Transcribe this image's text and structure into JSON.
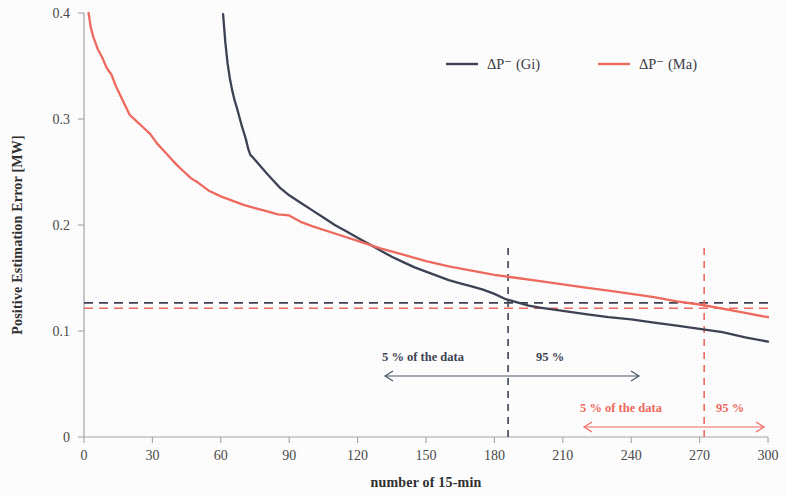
{
  "chart_data": {
    "type": "line",
    "title": "",
    "xlabel": "number of 15-min",
    "ylabel": "Positive Estimation Error [MW]",
    "xlim": [
      0,
      300
    ],
    "ylim": [
      0,
      0.4
    ],
    "grid": false,
    "legend_position": "top-right",
    "xticks": [
      "0",
      "30",
      "60",
      "90",
      "120",
      "150",
      "180",
      "210",
      "240",
      "270",
      "300"
    ],
    "xtick_values": [
      0,
      30,
      60,
      90,
      120,
      150,
      180,
      210,
      240,
      270,
      300
    ],
    "yticks": [
      "0",
      "0.1",
      "0.2",
      "0.3",
      "0.4"
    ],
    "ytick_values": [
      0,
      0.1,
      0.2,
      0.3,
      0.4
    ],
    "series": [
      {
        "name": "ΔP⁻ (Gi)",
        "color": "#3d4354",
        "style": "solid",
        "x": [
          61,
          62,
          63,
          64,
          65,
          66,
          67,
          68,
          69,
          70,
          71,
          72,
          73,
          74,
          76,
          78,
          80,
          83,
          86,
          90,
          95,
          100,
          105,
          110,
          115,
          120,
          125,
          130,
          135,
          140,
          145,
          150,
          155,
          160,
          165,
          170,
          175,
          180,
          185,
          190,
          195,
          200,
          210,
          220,
          230,
          240,
          250,
          260,
          270,
          280,
          290,
          300
        ],
        "y": [
          0.399,
          0.372,
          0.352,
          0.338,
          0.327,
          0.318,
          0.311,
          0.303,
          0.295,
          0.288,
          0.281,
          0.272,
          0.266,
          0.264,
          0.259,
          0.254,
          0.249,
          0.242,
          0.235,
          0.228,
          0.221,
          0.214,
          0.207,
          0.2,
          0.194,
          0.188,
          0.182,
          0.176,
          0.17,
          0.165,
          0.16,
          0.156,
          0.152,
          0.148,
          0.145,
          0.142,
          0.139,
          0.135,
          0.13,
          0.127,
          0.124,
          0.122,
          0.119,
          0.116,
          0.113,
          0.111,
          0.108,
          0.105,
          0.102,
          0.099,
          0.094,
          0.09
        ]
      },
      {
        "name": "ΔP⁻ (Ma)",
        "color": "#ef6a5e",
        "style": "solid",
        "x": [
          2,
          3,
          4,
          5,
          6,
          8,
          10,
          12,
          14,
          16,
          18,
          20,
          23,
          26,
          29,
          32,
          35,
          38,
          41,
          44,
          47,
          50,
          55,
          60,
          65,
          70,
          75,
          80,
          85,
          90,
          95,
          100,
          110,
          120,
          130,
          140,
          150,
          160,
          170,
          180,
          190,
          200,
          210,
          220,
          230,
          240,
          250,
          260,
          270,
          280,
          290,
          300
        ],
        "y": [
          0.4,
          0.386,
          0.378,
          0.372,
          0.366,
          0.358,
          0.348,
          0.342,
          0.331,
          0.322,
          0.313,
          0.304,
          0.298,
          0.292,
          0.286,
          0.277,
          0.27,
          0.263,
          0.256,
          0.25,
          0.244,
          0.24,
          0.232,
          0.227,
          0.223,
          0.219,
          0.216,
          0.213,
          0.21,
          0.209,
          0.203,
          0.199,
          0.192,
          0.185,
          0.178,
          0.172,
          0.166,
          0.161,
          0.157,
          0.153,
          0.15,
          0.147,
          0.144,
          0.141,
          0.138,
          0.135,
          0.132,
          0.128,
          0.125,
          0.121,
          0.117,
          0.113
        ]
      }
    ],
    "reference_lines": [
      {
        "name": "gi-horizontal-threshold",
        "orientation": "horizontal",
        "value": 0.1265,
        "color": "#3d4354",
        "style": "dashed"
      },
      {
        "name": "ma-horizontal-threshold",
        "orientation": "horizontal",
        "value": 0.1215,
        "color": "#ef6a5e",
        "style": "dashed"
      },
      {
        "name": "gi-vertical-percentile",
        "orientation": "vertical",
        "value": 186,
        "color": "#3d4354",
        "style": "dashed"
      },
      {
        "name": "ma-vertical-percentile",
        "orientation": "vertical",
        "value": 272,
        "color": "#ef6a5e",
        "style": "dashed"
      }
    ],
    "annotations": [
      {
        "name": "gi-left-label",
        "text": "5 % of the data",
        "color": "#3c4454",
        "x": 150,
        "y": 0.0595
      },
      {
        "name": "gi-right-label",
        "text": "95 %",
        "color": "#3c4454",
        "x": 212,
        "y": 0.0595
      },
      {
        "name": "ma-left-label",
        "text": "5 % of the data",
        "color": "#ef6a5e",
        "x": 240,
        "y": 0.0285
      },
      {
        "name": "ma-right-label",
        "text": "95 %",
        "color": "#ef6a5e",
        "x": 286,
        "y": 0.0285
      }
    ]
  },
  "axes": {
    "y_title": "Positive Estimation Error [MW]",
    "x_title": "number of 15-min",
    "x_ticks": [
      "0",
      "30",
      "60",
      "90",
      "120",
      "150",
      "180",
      "210",
      "240",
      "270",
      "300"
    ],
    "y_ticks": [
      "0.4",
      "0.3",
      "0.2",
      "0.1",
      "0"
    ]
  },
  "legend": {
    "entries": [
      {
        "label": "ΔP⁻ (Gi)",
        "color": "#3d4354"
      },
      {
        "label": "ΔP⁻ (Ma)",
        "color": "#ef6a5e"
      }
    ]
  },
  "annotations": {
    "dark_left": "5 % of the data",
    "dark_right": "95 %",
    "red_left": "5 % of the data",
    "red_right": "95 %"
  },
  "colors": {
    "gi": "#3d4354",
    "ma": "#ef6a5e",
    "axis": "#9a9a9a",
    "text": "#3a3a3a"
  }
}
